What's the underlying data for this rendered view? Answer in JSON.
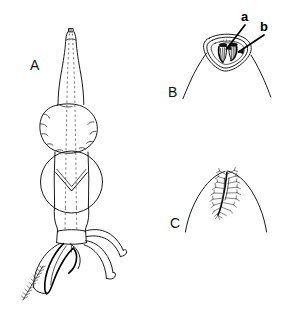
{
  "figure": {
    "type": "scientific-line-drawing",
    "background_color": "#ffffff",
    "ink_color": "#1a1a1a",
    "width": 294,
    "height": 310,
    "panels": [
      {
        "id": "A",
        "label": "A",
        "label_position": {
          "x": 30,
          "y": 58
        },
        "description": "Whole structure in dorsal view: elongate tapering apical segment with small terminal knob, a rounded lobed body segment, a circular segment bearing a chevron mark, a basal segment, and several curved tubular appendages trailing to the lower right plus a bristled filament to the lower left"
      },
      {
        "id": "B",
        "label": "B",
        "label_position": {
          "x": 168,
          "y": 85
        },
        "description": "Detail of apex: triangular rimmed aperture with internal paired structures, flanked by two diverging outline strokes"
      },
      {
        "id": "C",
        "label": "C",
        "label_position": {
          "x": 170,
          "y": 216
        },
        "description": "Detail of apex: parabolic outline enclosing a central plumose bristled axis"
      }
    ],
    "part_labels": [
      {
        "id": "a",
        "label": "a",
        "label_position": {
          "x": 241,
          "y": 10
        },
        "points_to": "inner-left-structure-in-panel-B"
      },
      {
        "id": "b",
        "label": "b",
        "label_position": {
          "x": 260,
          "y": 20
        },
        "points_to": "inner-right-structure-in-panel-B"
      }
    ]
  }
}
